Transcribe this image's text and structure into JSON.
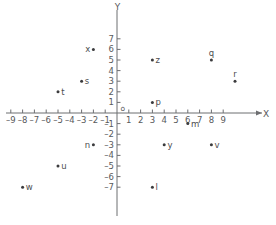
{
  "chart_data": {
    "type": "scatter",
    "title": "",
    "xlabel": "X",
    "ylabel": "Y",
    "origin_label": "o",
    "xlim": [
      -9,
      9
    ],
    "ylim": [
      -7,
      7
    ],
    "grid": false,
    "legend": "none",
    "xticks": [
      -9,
      -8,
      -7,
      -6,
      -5,
      -4,
      -3,
      -2,
      -1,
      1,
      2,
      3,
      4,
      5,
      6,
      7,
      8,
      9
    ],
    "xtick_labels": [
      "-9",
      "-8",
      "-7",
      "-6",
      "-5",
      "-4",
      "-3",
      "-2",
      "-1",
      "1",
      "2",
      "3",
      "4",
      "5",
      "6",
      "7",
      "8",
      "9"
    ],
    "yticks": [
      7,
      6,
      5,
      4,
      3,
      2,
      1,
      -1,
      -2,
      -3,
      -4,
      -5,
      -6,
      -7
    ],
    "ytick_labels": [
      "7",
      "6",
      "5",
      "4",
      "3",
      "2",
      "1",
      "-1",
      "-2",
      "-3",
      "-4",
      "-5",
      "-6",
      "-7"
    ],
    "points": [
      {
        "label": "x",
        "x": -2,
        "y": 6,
        "label_side": "left"
      },
      {
        "label": "s",
        "x": -3,
        "y": 3,
        "label_side": "right"
      },
      {
        "label": "t",
        "x": -5,
        "y": 2,
        "label_side": "right"
      },
      {
        "label": "z",
        "x": 3,
        "y": 5,
        "label_side": "right"
      },
      {
        "label": "q",
        "x": 8,
        "y": 5,
        "label_side": "above"
      },
      {
        "label": "r",
        "x": 10,
        "y": 3,
        "label_side": "above"
      },
      {
        "label": "p",
        "x": 3,
        "y": 1,
        "label_side": "right"
      },
      {
        "label": "n",
        "x": -2,
        "y": -3,
        "label_side": "left"
      },
      {
        "label": "u",
        "x": -5,
        "y": -5,
        "label_side": "right"
      },
      {
        "label": "w",
        "x": -8,
        "y": -7,
        "label_side": "right"
      },
      {
        "label": "m",
        "x": 6,
        "y": -1,
        "label_side": "right"
      },
      {
        "label": "y",
        "x": 4,
        "y": -3,
        "label_side": "right"
      },
      {
        "label": "v",
        "x": 8,
        "y": -3,
        "label_side": "right"
      },
      {
        "label": "l",
        "x": 3,
        "y": -7,
        "label_side": "right"
      }
    ]
  },
  "colors": {
    "axis": "#6d6e71",
    "text": "#58595b",
    "point": "#3b3b3d",
    "background": "#ffffff"
  }
}
